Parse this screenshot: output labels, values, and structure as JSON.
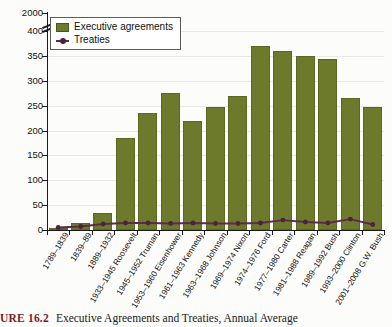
{
  "figure": {
    "caption_number": "URE 16.2",
    "caption_text": "Executive Agreements and Treaties, Annual Average"
  },
  "legend": {
    "position": "top-left",
    "items": [
      {
        "label": "Executive agreements",
        "icon": "filled-square-swatch",
        "color": "#6e7a2b"
      },
      {
        "label": "Treaties",
        "icon": "line-with-dot-swatch",
        "color": "#5c2a4e"
      }
    ]
  },
  "chart_data": {
    "type": "bar",
    "title": "Executive Agreements and Treaties, Annual Average",
    "xlabel": "",
    "ylabel": "",
    "ylim": [
      0,
      400
    ],
    "yticks": [
      0,
      50,
      100,
      150,
      200,
      250,
      300,
      350,
      400,
      2000
    ],
    "ytick_labels": [
      "0",
      "50",
      "100",
      "150",
      "200",
      "250",
      "300",
      "350",
      "400",
      "2000"
    ],
    "axis_break": true,
    "axis_break_note": "Y axis broken between 400 and 2000",
    "grid": true,
    "categories": [
      "1789–1839",
      "1839–89",
      "1889–1932",
      "1933–1945 Roosevelt",
      "1945–1952 Truman",
      "1953–1960 Eisenhower",
      "1961–1963 Kennedy",
      "1963–1968 Johnson",
      "1969–1974 Nixon",
      "1974–1976 Ford",
      "1977–1980 Carter",
      "1981–1988 Reagan",
      "1989–1992 Bush",
      "1993–2000 Clinton",
      "2001–2008 G.W. Bush"
    ],
    "series": [
      {
        "name": "Executive agreements",
        "type": "bar",
        "color": "#6e7a2b",
        "values": [
          5,
          15,
          35,
          185,
          235,
          275,
          220,
          248,
          270,
          370,
          360,
          350,
          343,
          265,
          248
        ]
      },
      {
        "name": "Treaties",
        "type": "line",
        "color": "#5c2a4e",
        "values": [
          5,
          7,
          12,
          14,
          14,
          13,
          14,
          13,
          13,
          14,
          20,
          16,
          14,
          22,
          11
        ]
      }
    ]
  }
}
